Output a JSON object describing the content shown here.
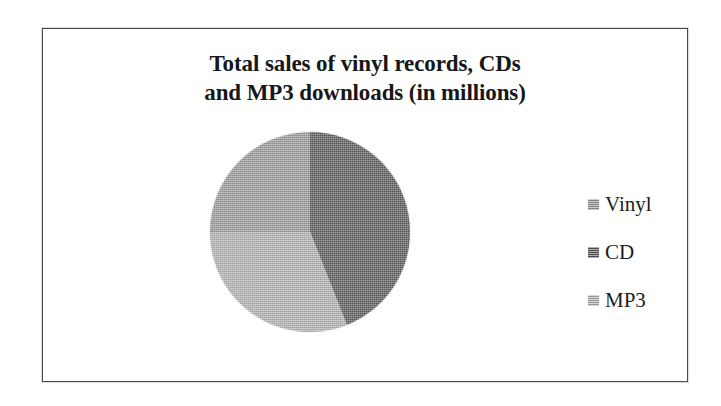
{
  "chart_data": {
    "type": "pie",
    "title": "Total sales of vinyl records, CDs and MP3 downloads (in millions)",
    "title_lines": [
      "Total sales of vinyl records, CDs",
      "and MP3 downloads (in millions)"
    ],
    "categories": [
      "Vinyl",
      "CD",
      "MP3"
    ],
    "values": [
      25,
      44,
      31
    ],
    "unit": "millions",
    "legend_position": "right",
    "grid": false,
    "xlabel": "",
    "ylabel": "",
    "data_labels_shown": false,
    "slices": [
      {
        "label": "Vinyl",
        "value": 25,
        "percent": 25,
        "color": "#9a9a9a",
        "start_angle_deg": 270,
        "end_angle_deg": 356
      },
      {
        "label": "CD",
        "value": 44,
        "percent": 44,
        "color": "#5c5c5c",
        "start_angle_deg": 356,
        "end_angle_deg": 160
      },
      {
        "label": "MP3",
        "value": 31,
        "percent": 31,
        "color": "#b2b2b2",
        "start_angle_deg": 160,
        "end_angle_deg": 270
      }
    ]
  },
  "legend": {
    "items": [
      {
        "label": "Vinyl",
        "swatch_name": "legend-swatch-vinyl",
        "color": "#9a9a9a"
      },
      {
        "label": "CD",
        "swatch_name": "legend-swatch-cd",
        "color": "#5c5c5c"
      },
      {
        "label": "MP3",
        "swatch_name": "legend-swatch-mp3",
        "color": "#b2b2b2"
      }
    ]
  },
  "style": {
    "background": "#ffffff",
    "frame_border": "#4a4a4a",
    "title_color": "#171717",
    "label_color": "#1c1c1c"
  }
}
